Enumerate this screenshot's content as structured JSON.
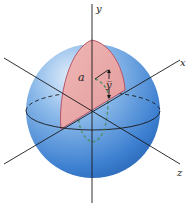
{
  "diagram": {
    "labels": {
      "y_axis": "y",
      "x_axis": "x",
      "z_axis": "z",
      "radius": "a",
      "centroid": "y̅"
    },
    "colors": {
      "sphere_light": "#cfe3f7",
      "sphere_mid": "#6fa6e0",
      "sphere_dark": "#2f6fc0",
      "half_disk_fill": "#e9a9a9",
      "half_disk_edge": "#b4475a",
      "dashed_path": "#4f8f6a",
      "axis": "#1a1a1a"
    }
  }
}
